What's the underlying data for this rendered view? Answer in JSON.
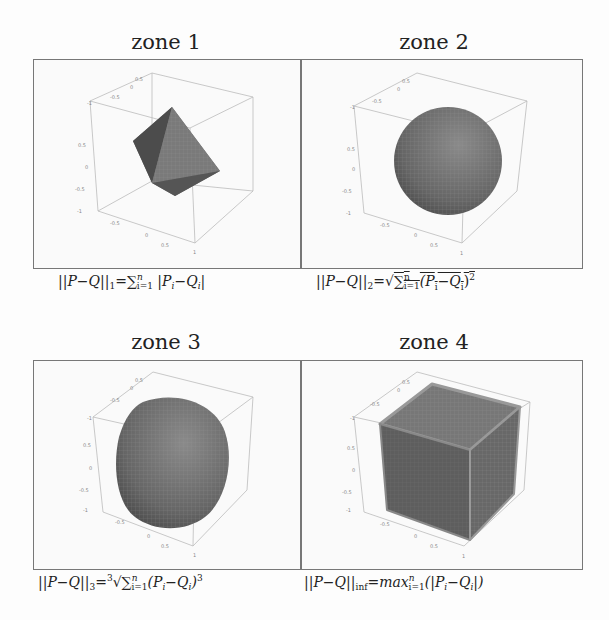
{
  "figure": {
    "panels": [
      {
        "id": "zone1",
        "title": "zone 1",
        "shape": "octahedron",
        "norm": "L1",
        "caption_parts": {
          "lhs": "||P−Q||",
          "sub": "1",
          "rhs_prefix": "=∑",
          "sum_sup": "n",
          "sum_sub": "i=1",
          "body": " |P",
          "i": "i",
          "mid": "−Q",
          "end": "|"
        }
      },
      {
        "id": "zone2",
        "title": "zone 2",
        "shape": "sphere",
        "norm": "L2",
        "caption_parts": {
          "lhs": "||P−Q||",
          "sub": "2",
          "rhs_prefix": "=√",
          "sum_sup": "n",
          "sum_sub": "i=1",
          "body": "(P",
          "i": "i",
          "mid": "−Q",
          "end": ")",
          "pow": "2"
        }
      },
      {
        "id": "zone3",
        "title": "zone 3",
        "shape": "superellipsoid-p3",
        "norm": "L3",
        "caption_parts": {
          "lhs": "||P−Q||",
          "sub": "3",
          "root": "3",
          "rhs_prefix": "=√",
          "sum_sup": "n",
          "sum_sub": "i=1",
          "body": "(P",
          "i": "i",
          "mid": "−Q",
          "end": ")",
          "pow": "3"
        }
      },
      {
        "id": "zone4",
        "title": "zone 4",
        "shape": "cube",
        "norm": "Linf",
        "caption_parts": {
          "lhs": "||P−Q||",
          "sub": "inf",
          "rhs_prefix": "=max",
          "sum_sup": "n",
          "sum_sub": "i=1",
          "body": "(|P",
          "i": "i",
          "mid": "−Q",
          "end": "|)"
        }
      }
    ],
    "axis_ticks": [
      "-1",
      "-0.5",
      "0",
      "0.5",
      "1"
    ]
  }
}
